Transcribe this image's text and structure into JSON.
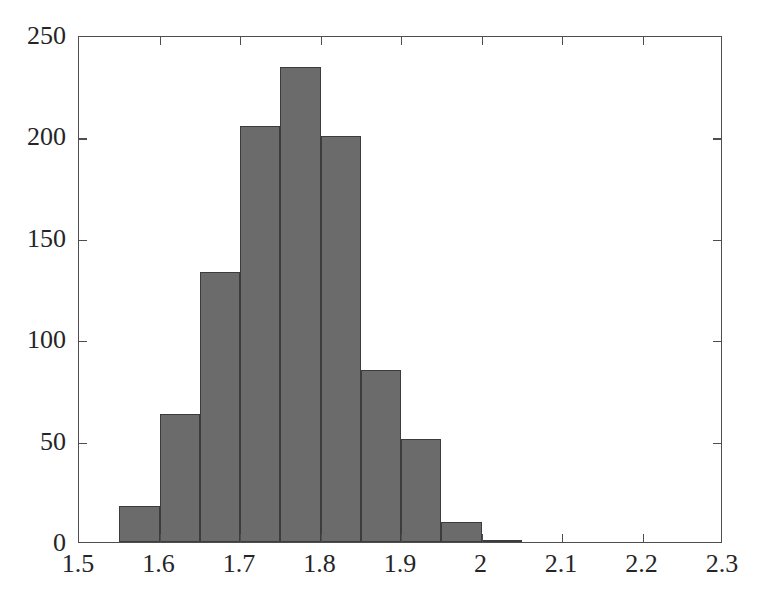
{
  "chart_data": {
    "type": "bar",
    "title": "",
    "subtitle": "",
    "xlabel": "",
    "ylabel": "",
    "xlim": [
      1.5,
      2.3
    ],
    "ylim": [
      0,
      250
    ],
    "grid": false,
    "legend": null,
    "bin_width": 0.05,
    "bar_color": "#6b6b6b",
    "bar_edge_color": "#3c3c3e",
    "axis_color": "#4e4e52",
    "background_color": "#ffffff",
    "xticks": [
      {
        "value": 1.5,
        "label": "1.5"
      },
      {
        "value": 1.6,
        "label": "1.6"
      },
      {
        "value": 1.7,
        "label": "1.7"
      },
      {
        "value": 1.8,
        "label": "1.8"
      },
      {
        "value": 1.9,
        "label": "1.9"
      },
      {
        "value": 2.0,
        "label": "2"
      },
      {
        "value": 2.1,
        "label": "2.1"
      },
      {
        "value": 2.2,
        "label": "2.2"
      },
      {
        "value": 2.3,
        "label": "2.3"
      }
    ],
    "yticks": [
      {
        "value": 0,
        "label": "0"
      },
      {
        "value": 50,
        "label": "50"
      },
      {
        "value": 100,
        "label": "100"
      },
      {
        "value": 150,
        "label": "150"
      },
      {
        "value": 200,
        "label": "200"
      },
      {
        "value": 250,
        "label": "250"
      }
    ],
    "bins": [
      {
        "x0": 1.55,
        "x1": 1.6,
        "count": 18
      },
      {
        "x0": 1.6,
        "x1": 1.65,
        "count": 63
      },
      {
        "x0": 1.65,
        "x1": 1.7,
        "count": 133
      },
      {
        "x0": 1.7,
        "x1": 1.75,
        "count": 205
      },
      {
        "x0": 1.75,
        "x1": 1.8,
        "count": 234
      },
      {
        "x0": 1.8,
        "x1": 1.85,
        "count": 200
      },
      {
        "x0": 1.85,
        "x1": 1.9,
        "count": 85
      },
      {
        "x0": 1.9,
        "x1": 1.95,
        "count": 51
      },
      {
        "x0": 1.95,
        "x1": 2.0,
        "count": 10
      },
      {
        "x0": 2.0,
        "x1": 2.05,
        "count": 1
      }
    ],
    "categories": [
      "1.55-1.60",
      "1.60-1.65",
      "1.65-1.70",
      "1.70-1.75",
      "1.75-1.80",
      "1.80-1.85",
      "1.85-1.90",
      "1.90-1.95",
      "1.95-2.00",
      "2.00-2.05"
    ],
    "values": [
      18,
      63,
      133,
      205,
      234,
      200,
      85,
      51,
      10,
      1
    ]
  }
}
